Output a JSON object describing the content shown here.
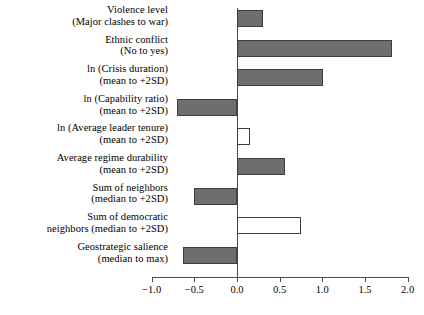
{
  "chart_data": {
    "type": "bar",
    "orientation": "horizontal",
    "title": "",
    "subtitle": "",
    "xlabel": "",
    "ylabel": "",
    "xlim": [
      -1.0,
      2.0
    ],
    "grid": false,
    "legend": null,
    "axis_ticks": [
      "−1.0",
      "−0.5",
      "0.0",
      "0.5",
      "1.0",
      "1.5",
      "2.0"
    ],
    "axis_tick_values": [
      -1.0,
      -0.5,
      0.0,
      0.5,
      1.0,
      1.5,
      2.0
    ],
    "zero_reference": 0.0,
    "categories": [
      "Violence level (Major clashes to war)",
      "Ethnic conflict (No to yes)",
      "ln (Crisis duration) (mean to +2SD)",
      "ln (Capability ratio) (mean to +2SD)",
      "ln (Average leader tenure) (mean to +2SD)",
      "Average regime durability (mean to +2SD)",
      "Sum of neighbors (median to +2SD)",
      "Sum of democratic neighbors (median to +2SD)",
      "Geostrategic salience (median to max)"
    ],
    "values": [
      0.31,
      1.82,
      1.01,
      -0.7,
      0.15,
      0.56,
      -0.5,
      0.75,
      -0.63
    ],
    "bars": [
      {
        "label_line1": "Violence level",
        "label_line2": "(Major clashes to war)",
        "value": 0.31,
        "fill": "filled"
      },
      {
        "label_line1": "Ethnic conflict",
        "label_line2": "(No to yes)",
        "value": 1.82,
        "fill": "filled"
      },
      {
        "label_line1": "ln (Crisis duration)",
        "label_line2": "(mean to +2SD)",
        "value": 1.01,
        "fill": "filled"
      },
      {
        "label_line1": "ln (Capability ratio)",
        "label_line2": "(mean to +2SD)",
        "value": -0.7,
        "fill": "filled"
      },
      {
        "label_line1": "ln (Average leader tenure)",
        "label_line2": "(mean to +2SD)",
        "value": 0.15,
        "fill": "hollow"
      },
      {
        "label_line1": "Average regime durability",
        "label_line2": "(mean to +2SD)",
        "value": 0.56,
        "fill": "filled"
      },
      {
        "label_line1": "Sum of neighbors",
        "label_line2": "(median to +2SD)",
        "value": -0.5,
        "fill": "filled"
      },
      {
        "label_line1": "Sum of democratic",
        "label_line2": "neighbors (median to +2SD)",
        "value": 0.75,
        "fill": "hollow"
      },
      {
        "label_line1": "Geostrategic salience",
        "label_line2": "(median to max)",
        "value": -0.63,
        "fill": "filled"
      }
    ],
    "colors": {
      "bar_fill": "#6e6e6e",
      "bar_hollow_fill": "#ffffff",
      "bar_border": "#3d3d3d",
      "axis": "#4a4a4a",
      "text": "#000000",
      "background": "#ffffff"
    }
  }
}
